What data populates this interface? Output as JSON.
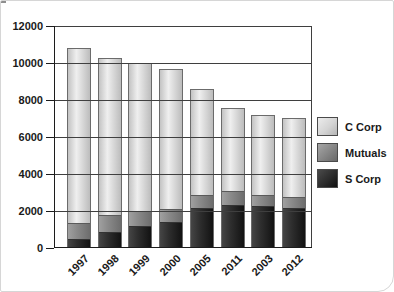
{
  "chart_data": {
    "type": "bar",
    "stacked": true,
    "title": "",
    "xlabel": "",
    "ylabel": "",
    "categories": [
      "1997",
      "1998",
      "1999",
      "2000",
      "2005",
      "2011",
      "2003",
      "2012"
    ],
    "series": [
      {
        "name": "S Corp",
        "values": [
          450,
          800,
          1150,
          1350,
          2100,
          2250,
          2200,
          2100
        ]
      },
      {
        "name": "Mutuals",
        "values": [
          850,
          900,
          800,
          700,
          700,
          750,
          600,
          600
        ]
      },
      {
        "name": "C Corp",
        "values": [
          9500,
          8550,
          8050,
          7650,
          5800,
          4550,
          4400,
          4300
        ]
      }
    ],
    "totals": [
      10800,
      10250,
      10000,
      9700,
      8600,
      7550,
      7200,
      7000
    ],
    "y_ticks": [
      0,
      2000,
      4000,
      6000,
      8000,
      10000,
      12000
    ],
    "ylim": [
      0,
      12000
    ],
    "grid": true,
    "gridlines_over_bars": true,
    "legend_position": "right"
  },
  "legend": {
    "items": [
      {
        "label": "C Corp"
      },
      {
        "label": "Mutuals"
      },
      {
        "label": "S Corp"
      }
    ]
  },
  "colors": {
    "c_corp": "#d9d9d9",
    "mutuals": "#8a8a8a",
    "s_corp": "#2b2b2b",
    "gridline": "#3f3f3f",
    "axis": "#1c1c1c",
    "text": "#1a1a1a",
    "bar_border": "#6b6b6b",
    "background": "#ffffff"
  }
}
